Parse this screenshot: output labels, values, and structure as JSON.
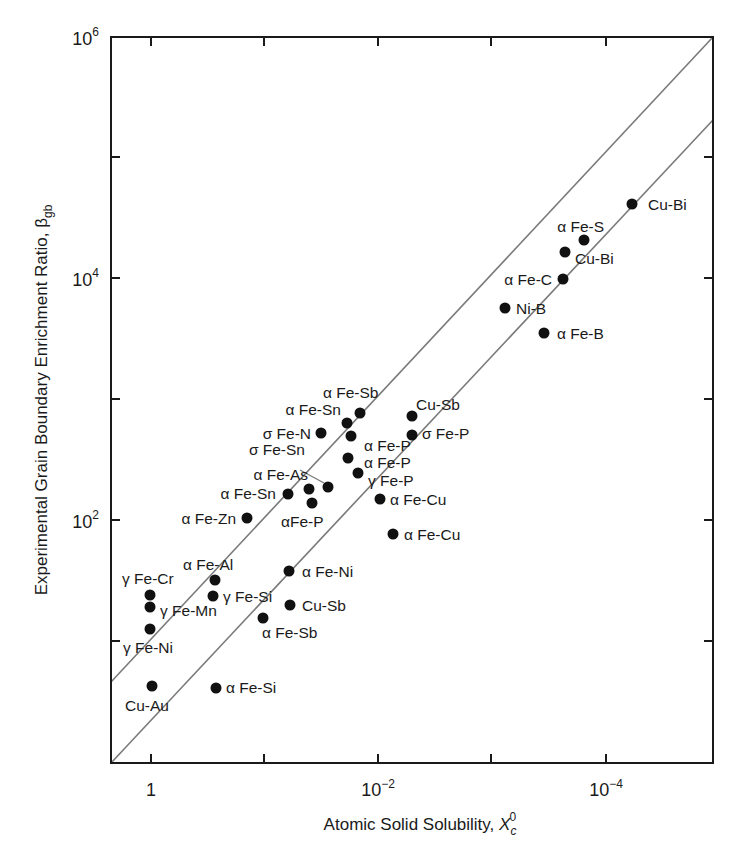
{
  "chart_data": {
    "type": "scatter",
    "title": "",
    "xlabel": "Atomic Solid Solubility, X_c^0",
    "xlabel_main": "Atomic Solid Solubility, ",
    "xlabel_symbol": "X",
    "xlabel_sub": "c",
    "xlabel_sup": "0",
    "ylabel": "Experimental Grain Boundary Enrichment Ratio, β_gb",
    "ylabel_main": "Experimental Grain Boundary Enrichment Ratio, ",
    "ylabel_symbol": "β",
    "ylabel_sub": "gb",
    "xscale": "log (reversed)",
    "yscale": "log",
    "xlim": [
      3.0,
      2e-06
    ],
    "ylim": [
      1.0,
      1000000
    ],
    "grid": false,
    "legend": "none",
    "x_ticks": [
      {
        "label_base": "1",
        "label_exp": "",
        "value": 1,
        "px": 151
      },
      {
        "label_base": "",
        "label_exp": "",
        "value": 0.1,
        "px": 264
      },
      {
        "label_base": "10",
        "label_exp": "−2",
        "value": 0.01,
        "px": 378
      },
      {
        "label_base": "",
        "label_exp": "",
        "value": 0.001,
        "px": 491
      },
      {
        "label_base": "10",
        "label_exp": "−4",
        "value": 0.0001,
        "px": 606
      }
    ],
    "y_ticks": [
      {
        "label_base": "10",
        "label_exp": "6",
        "value": 1000000,
        "px": 37
      },
      {
        "label_base": "",
        "label_exp": "",
        "value": 100000,
        "px": 157
      },
      {
        "label_base": "10",
        "label_exp": "4",
        "value": 10000,
        "px": 278
      },
      {
        "label_base": "",
        "label_exp": "",
        "value": 1000,
        "px": 399
      },
      {
        "label_base": "10",
        "label_exp": "2",
        "value": 100,
        "px": 520
      },
      {
        "label_base": "",
        "label_exp": "",
        "value": 10,
        "px": 641
      }
    ],
    "reference_lines": [
      {
        "name": "upper-bound-line",
        "x1": 111,
        "y1": 682,
        "x2": 713,
        "y2": 37
      },
      {
        "name": "lower-bound-line",
        "x1": 111,
        "y1": 763,
        "x2": 713,
        "y2": 120
      }
    ],
    "points": [
      {
        "label": "Cu-Bi",
        "x": 6.4e-05,
        "y": 40000,
        "px": 632,
        "py": 204,
        "lx": 648,
        "ly": 210,
        "anchor": "start"
      },
      {
        "label": "α Fe-S",
        "x": 0.00017,
        "y": 20000,
        "px": 584,
        "py": 240,
        "lx": 604,
        "ly": 232,
        "anchor": "end"
      },
      {
        "label": "Cu-Bi",
        "x": 0.00025,
        "y": 16500,
        "px": 565,
        "py": 252,
        "lx": 575,
        "ly": 264,
        "anchor": "start"
      },
      {
        "label": "α Fe-C",
        "x": 0.00025,
        "y": 10000,
        "px": 563,
        "py": 279,
        "lx": 552,
        "ly": 285,
        "anchor": "end"
      },
      {
        "label": "Ni-B",
        "x": 0.00082,
        "y": 5500,
        "px": 505,
        "py": 308,
        "lx": 516,
        "ly": 314,
        "anchor": "start"
      },
      {
        "label": "α Fe-B",
        "x": 0.0004,
        "y": 3400,
        "px": 544,
        "py": 333,
        "lx": 557,
        "ly": 339,
        "anchor": "start"
      },
      {
        "label": "α Fe-Sb",
        "x": 0.0087,
        "y": 780,
        "px": 360,
        "py": 413,
        "lx": 323,
        "ly": 398,
        "anchor": "start"
      },
      {
        "label": "α Fe-Sn",
        "x": 0.011,
        "y": 640,
        "px": 347,
        "py": 423,
        "lx": 341,
        "ly": 415,
        "anchor": "end"
      },
      {
        "label": "σ Fe-N",
        "x": 0.018,
        "y": 530,
        "px": 321,
        "py": 433,
        "lx": 311,
        "ly": 439,
        "anchor": "end"
      },
      {
        "label": "Cu-Sb",
        "x": 0.0034,
        "y": 730,
        "px": 412,
        "py": 416,
        "lx": 416,
        "ly": 410,
        "anchor": "start"
      },
      {
        "label": "σ Fe-P",
        "x": 0.0034,
        "y": 510,
        "px": 412,
        "py": 435,
        "lx": 422,
        "ly": 439,
        "anchor": "start"
      },
      {
        "label": "α Fe-P",
        "x": 0.0112,
        "y": 500,
        "px": 351,
        "py": 436,
        "lx": 364,
        "ly": 451,
        "anchor": "start"
      },
      {
        "label": "α Fe-P",
        "x": 0.0119,
        "y": 330,
        "px": 348,
        "py": 458,
        "lx": 364,
        "ly": 468,
        "anchor": "start"
      },
      {
        "label": "γ Fe-P",
        "x": 0.0097,
        "y": 250,
        "px": 358,
        "py": 473,
        "lx": 368,
        "ly": 486,
        "anchor": "start"
      },
      {
        "label": "σ Fe-Sn",
        "x": 0.015,
        "y": 195,
        "px": 328,
        "py": 487,
        "lx": 305,
        "ly": 455,
        "anchor": "end",
        "leader": [
          300,
          470,
          324,
          483
        ]
      },
      {
        "label": "α Fe-As",
        "x": 0.022,
        "y": 190,
        "px": 309,
        "py": 489,
        "lx": 308,
        "ly": 480,
        "anchor": "end"
      },
      {
        "label": "α Fe-Sn",
        "x": 0.032,
        "y": 172,
        "px": 288,
        "py": 494,
        "lx": 276,
        "ly": 499,
        "anchor": "end"
      },
      {
        "label": "αFe-P",
        "x": 0.021,
        "y": 145,
        "px": 312,
        "py": 503,
        "lx": 281,
        "ly": 527,
        "anchor": "start"
      },
      {
        "label": "α Fe-Cu",
        "x": 0.0063,
        "y": 165,
        "px": 380,
        "py": 499,
        "lx": 390,
        "ly": 505,
        "anchor": "start"
      },
      {
        "label": "α Fe-Cu",
        "x": 0.0047,
        "y": 85,
        "px": 393,
        "py": 534,
        "lx": 404,
        "ly": 540,
        "anchor": "start"
      },
      {
        "label": "α Fe-Zn",
        "x": 0.142,
        "y": 104,
        "px": 247,
        "py": 518,
        "lx": 236,
        "ly": 524,
        "anchor": "end"
      },
      {
        "label": "α Fe-Al",
        "x": 0.28,
        "y": 34,
        "px": 215,
        "py": 580,
        "lx": 183,
        "ly": 570,
        "anchor": "start"
      },
      {
        "label": "γ Fe-Si",
        "x": 0.29,
        "y": 25,
        "px": 213,
        "py": 596,
        "lx": 223,
        "ly": 602,
        "anchor": "start"
      },
      {
        "label": "γ Fe-Cr",
        "x": 1.0,
        "y": 25,
        "px": 150,
        "py": 595,
        "lx": 122,
        "ly": 584,
        "anchor": "start"
      },
      {
        "label": "γ Fe-Mn",
        "x": 1.0,
        "y": 20,
        "px": 150,
        "py": 607,
        "lx": 160,
        "ly": 616,
        "anchor": "start"
      },
      {
        "label": "γ Fe-Ni",
        "x": 1.0,
        "y": 13,
        "px": 150,
        "py": 629,
        "lx": 123,
        "ly": 653,
        "anchor": "start"
      },
      {
        "label": "α Fe-Ni",
        "x": 0.047,
        "y": 37,
        "px": 289,
        "py": 571,
        "lx": 302,
        "ly": 577,
        "anchor": "start"
      },
      {
        "label": "Cu-Sb",
        "x": 0.046,
        "y": 20,
        "px": 290,
        "py": 605,
        "lx": 302,
        "ly": 611,
        "anchor": "start"
      },
      {
        "label": "α Fe-Sb",
        "x": 0.1,
        "y": 15,
        "px": 263,
        "py": 618,
        "lx": 262,
        "ly": 638,
        "anchor": "start"
      },
      {
        "label": "Cu-Au",
        "x": 0.98,
        "y": 4.3,
        "px": 152,
        "py": 686,
        "lx": 125,
        "ly": 711,
        "anchor": "start"
      },
      {
        "label": "α Fe-Si",
        "x": 0.27,
        "y": 4.1,
        "px": 216,
        "py": 688,
        "lx": 226,
        "ly": 693,
        "anchor": "start"
      }
    ]
  },
  "layout": {
    "frame": {
      "left": 111,
      "top": 37,
      "right": 713,
      "bottom": 763
    },
    "colors": {
      "axis": "#1a1a1a",
      "line": "#7a7a7a",
      "point": "#111111"
    }
  }
}
